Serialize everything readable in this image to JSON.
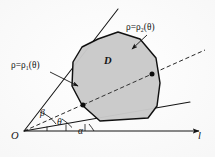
{
  "figure": {
    "kind": "polar-region-diagram",
    "caption_present": false,
    "background_color": "#fdfdfd",
    "ink_color": "#141414",
    "region_fill_color": "#c9c9c9",
    "region_stroke_color": "#101010"
  },
  "labels": {
    "rho_outer": {
      "lead": "ρ=ρ",
      "sub": "2",
      "arg": "(θ)"
    },
    "rho_inner": {
      "lead": "ρ=ρ",
      "sub": "1",
      "arg": "(θ)"
    },
    "region": "D",
    "origin": "O",
    "axis": "l",
    "angle_beta": "β",
    "angle_theta": "θ",
    "angle_alpha": "α"
  },
  "geometry": {
    "origin": {
      "x": 24,
      "y": 131
    },
    "axis_line": {
      "x1": 24,
      "y1": 131,
      "x2": 203,
      "y2": 131,
      "arrow": "right"
    },
    "ray_beta": {
      "x1": 24,
      "y1": 131,
      "x2": 118,
      "y2": 9,
      "angle_label": "β"
    },
    "ray_theta": {
      "x1": 24,
      "y1": 131,
      "x2": 205,
      "y2": 50,
      "angle_label": "θ",
      "style": "dashed"
    },
    "ray_alpha": {
      "x1": 24,
      "y1": 131,
      "x2": 190,
      "y2": 102,
      "angle_label": "α"
    },
    "intersections": [
      {
        "name": "rho1-point",
        "x": 83,
        "y": 105
      },
      {
        "name": "rho2-point",
        "x": 152,
        "y": 74
      }
    ],
    "leader_rho2": {
      "from_x": 146,
      "from_y": 36,
      "to_x": 131,
      "to_y": 49
    },
    "leader_rho1": {
      "from_x": 52,
      "from_y": 73,
      "to_x": 79,
      "to_y": 85
    },
    "region_outline": "M 98,39 L 118,32 L 140,39 L 156,58 L 160,83 L 157,106 L 148,118 L 100,121 L 82,105 L 72,86 L 73,62 L 82,47 Z"
  }
}
